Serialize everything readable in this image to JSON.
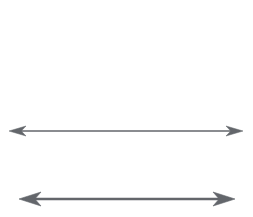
{
  "figure": {
    "title": "",
    "background_color": "#ffffff",
    "width": 253,
    "height": 217
  },
  "chart_data": {
    "type": "diagram",
    "title": "",
    "subtitle": "",
    "xlabel": "",
    "ylabel": "",
    "grid": false,
    "legend_position": "none",
    "annotations": [],
    "tick_labels": [],
    "shapes": [
      {
        "name": "top-double-arrow",
        "kind": "double-headed-arrow",
        "orientation": "horizontal",
        "direction": "both",
        "color": "#63666b",
        "shaft_thickness_px": 1.6,
        "head_style": "barbed-narrow",
        "head_length_px": 17,
        "head_half_width_px": 5,
        "x_start_px": 9,
        "x_end_px": 243,
        "y_px": 131,
        "length_px": 234,
        "label": ""
      },
      {
        "name": "bottom-double-arrow",
        "kind": "double-headed-arrow",
        "orientation": "horizontal",
        "direction": "both",
        "color": "#63666b",
        "shaft_thickness_px": 2.4,
        "head_style": "barbed-wide",
        "head_length_px": 22,
        "head_half_width_px": 7,
        "x_start_px": 19,
        "x_end_px": 235,
        "y_px": 199,
        "length_px": 216,
        "label": ""
      }
    ]
  },
  "labels": {
    "top_arrow_label": "",
    "bottom_arrow_label": ""
  }
}
